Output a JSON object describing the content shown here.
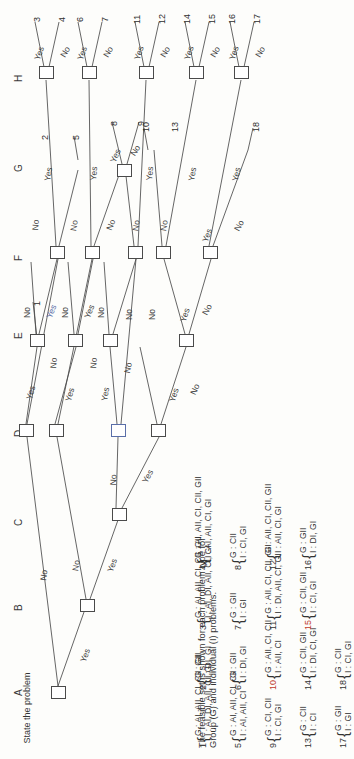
{
  "diagram": {
    "root_label": "State the problem",
    "column_labels": [
      "A",
      "B",
      "C",
      "D",
      "E",
      "F",
      "G",
      "H"
    ],
    "edge_yes": "Yes",
    "edge_no": "No",
    "leaf_numbers": [
      "1",
      "2",
      "3",
      "4",
      "5",
      "6",
      "7",
      "8",
      "9",
      "10",
      "11",
      "12",
      "13",
      "14",
      "15",
      "16",
      "17",
      "18"
    ]
  },
  "caption": {
    "line1": "The feasible set is shown for each problem type for",
    "line2": "Group (G) and individual (I) problems."
  },
  "legend": {
    "items": [
      {
        "index": "1",
        "group": "G : AI, AII, CI, CII, GII",
        "individual": "I  : AI, DI, AII, CI, GI",
        "highlight": false
      },
      {
        "index": "2",
        "group": "G : GII",
        "individual": "I  : DI, GI",
        "highlight": false
      },
      {
        "index": "3",
        "group": "G : AI, AII, CI, CII, GII",
        "individual": "I  : AI, DI, AII, CI, GI",
        "highlight": false
      },
      {
        "index": "4",
        "group": "G : AI, AII, CI, CII, GII",
        "individual": "I  : AI, AII, CI, GI",
        "highlight": false
      },
      {
        "index": "5",
        "group": "G : AI, AII, CI, CII",
        "individual": "I  : AI, AII, CI",
        "highlight": false
      },
      {
        "index": "6",
        "group": "G : GII",
        "individual": "I  : DI, GI",
        "highlight": false
      },
      {
        "index": "7",
        "group": "G : GII",
        "individual": "I  : GI",
        "highlight": false
      },
      {
        "index": "8",
        "group": "G : CII",
        "individual": "I  : CI, GI",
        "highlight": false
      },
      {
        "index": "9",
        "group": "G : CI, CII",
        "individual": "I  : CI, GI",
        "highlight": false
      },
      {
        "index": "10",
        "group": "G : AII, CI, CII",
        "individual": "I  : AII, CI",
        "highlight": true
      },
      {
        "index": "11",
        "group": "G : AII, CI, CII, GII",
        "individual": "I  : DI, AII, CI, GI",
        "highlight": false
      },
      {
        "index": "12",
        "group": "G : AII, CI, CII, GII",
        "individual": "I  : AII, CI, GI",
        "highlight": false
      },
      {
        "index": "13",
        "group": "G : CII",
        "individual": "I  : CI",
        "highlight": false
      },
      {
        "index": "14",
        "group": "G : CII, GII",
        "individual": "I  : DI, CI, GI",
        "highlight": false
      },
      {
        "index": "15",
        "group": "G : CII, GII",
        "individual": "I  : CI, GI",
        "highlight": true
      },
      {
        "index": "16",
        "group": "G : GII",
        "individual": "I  : DI, GI",
        "highlight": false
      },
      {
        "index": "17",
        "group": "G : GII",
        "individual": "I  : GI",
        "highlight": false
      },
      {
        "index": "18",
        "group": "G : CII",
        "individual": "I  : CI, GI",
        "highlight": false
      }
    ]
  },
  "colors": {
    "ink": "#4a4a4a",
    "text": "#333333",
    "highlight": "#c0392b",
    "accent_blue": "#5a6ea8",
    "paper": "#fdfdfb"
  }
}
